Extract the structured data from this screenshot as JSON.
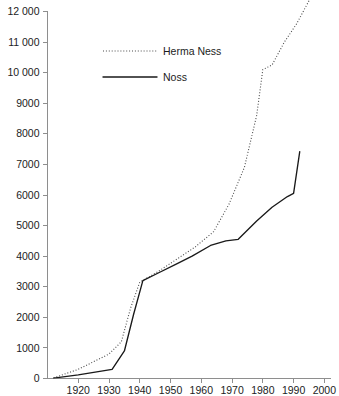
{
  "chart_data": {
    "type": "line",
    "title": "",
    "subtitle": "",
    "xlabel": "",
    "ylabel": "",
    "xlim": [
      1910,
      2002
    ],
    "ylim": [
      0,
      12000
    ],
    "grid": false,
    "legend_position": "top-left-inside",
    "x_ticks": [
      1920,
      1930,
      1940,
      1950,
      1960,
      1970,
      1980,
      1990,
      2000
    ],
    "x_tick_labels": [
      "1920",
      "1930",
      "1940",
      "1950",
      "1960",
      "1970",
      "1980",
      "1990",
      "2000"
    ],
    "y_ticks": [
      0,
      1000,
      2000,
      3000,
      4000,
      5000,
      6000,
      7000,
      8000,
      9000,
      10000,
      11000,
      12000
    ],
    "y_tick_labels": [
      "0",
      "1000",
      "2000",
      "3000",
      "4000",
      "5000",
      "6000",
      "7000",
      "8000",
      "9000",
      "10 000",
      "11 000",
      "12 000"
    ],
    "series": [
      {
        "name": "Herma Ness",
        "style": "dotted",
        "color": "#4a4a4a",
        "x": [
          1912,
          1920,
          1930,
          1934,
          1937,
          1940,
          1946,
          1952,
          1958,
          1964,
          1969,
          1974,
          1978,
          1980,
          1983,
          1987,
          1991,
          1995
        ],
        "values": [
          20,
          300,
          800,
          1200,
          2300,
          3150,
          3500,
          3900,
          4300,
          4800,
          5700,
          6900,
          8600,
          10100,
          10250,
          11000,
          11600,
          12350
        ]
      },
      {
        "name": "Noss",
        "style": "solid",
        "color": "#1a1a1a",
        "x": [
          1912,
          1920,
          1928,
          1931,
          1935,
          1938,
          1941,
          1946,
          1952,
          1957,
          1963,
          1968,
          1972,
          1978,
          1983,
          1988,
          1990,
          1992
        ],
        "values": [
          10,
          120,
          250,
          300,
          900,
          2100,
          3200,
          3450,
          3750,
          4000,
          4350,
          4500,
          4550,
          5150,
          5600,
          5950,
          6050,
          7420
        ]
      }
    ]
  },
  "legend": {
    "entries": [
      {
        "label": "Herma Ness",
        "style": "dotted"
      },
      {
        "label": "Noss",
        "style": "solid"
      }
    ]
  }
}
